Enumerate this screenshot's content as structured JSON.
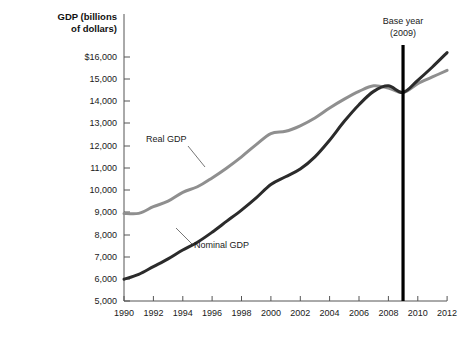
{
  "chart_data": {
    "type": "line",
    "title": "",
    "xlabel": "",
    "ylabel": "GDP (billions of dollars)",
    "ylabel_line1": "GDP (billions",
    "ylabel_line2": "of dollars)",
    "xlim": [
      1990,
      2012
    ],
    "ylim": [
      5000,
      16000
    ],
    "grid": false,
    "legend_position": "inline-annotations",
    "x_ticks": [
      1990,
      1992,
      1994,
      1996,
      1998,
      2000,
      2002,
      2004,
      2006,
      2008,
      2010,
      2012
    ],
    "x_tick_labels": [
      "1990",
      "1992",
      "1994",
      "1996",
      "1998",
      "2000",
      "2002",
      "2004",
      "2006",
      "2008",
      "2010",
      "2012"
    ],
    "y_ticks": [
      16000,
      15000,
      14000,
      13000,
      12000,
      11000,
      10000,
      9000,
      8000,
      7000,
      6000,
      5000
    ],
    "y_tick_labels": [
      "$16,000",
      "15,000",
      "14,000",
      "13,000",
      "12,000",
      "11,000",
      "10,000",
      "9,000",
      "8,000",
      "7,000",
      "6,000",
      "5,000"
    ],
    "x": [
      1990,
      1991,
      1992,
      1993,
      1994,
      1995,
      1996,
      1997,
      1998,
      1999,
      2000,
      2001,
      2002,
      2003,
      2004,
      2005,
      2006,
      2007,
      2008,
      2009,
      2010,
      2011,
      2012
    ],
    "series": [
      {
        "name": "Real GDP",
        "color": "#8f8f8f",
        "values": [
          8950,
          8950,
          9250,
          9500,
          9900,
          10150,
          10550,
          11000,
          11500,
          12050,
          12550,
          12650,
          12900,
          13250,
          13700,
          14100,
          14450,
          14700,
          14600,
          14400,
          14800,
          15100,
          15400
        ]
      },
      {
        "name": "Nominal GDP",
        "color": "#2b2b2b",
        "values": [
          5980,
          6200,
          6550,
          6900,
          7300,
          7650,
          8100,
          8600,
          9100,
          9650,
          10250,
          10600,
          10950,
          11500,
          12250,
          13100,
          13850,
          14450,
          14700,
          14400,
          14950,
          15550,
          16200
        ]
      }
    ],
    "annotations": [
      {
        "name": "base-year",
        "text": "Base year",
        "text_line2": "(2009)",
        "x_value": 2009,
        "color": "#000000"
      },
      {
        "name": "real-gdp-callout",
        "text": "Real GDP"
      },
      {
        "name": "nominal-gdp-callout",
        "text": "Nominal GDP"
      }
    ]
  }
}
